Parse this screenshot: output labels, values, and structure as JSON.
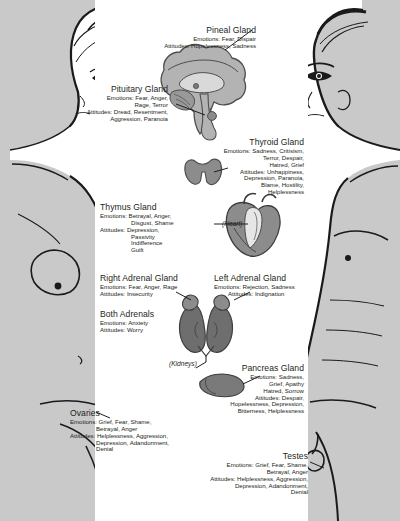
{
  "document": {
    "title": "Endocrine Glands, Emotions and Attitudes Chart",
    "background_color": "#ffffff",
    "body_fill_color": "#c9c9c9",
    "outline_color": "#1a1a1a",
    "organ_fill_color": "#8c8c8c",
    "text_color": "#231f20"
  },
  "figures": {
    "left": {
      "name": "female-figure",
      "caption": ""
    },
    "right": {
      "name": "male-figure",
      "caption": ""
    }
  },
  "organ_captions": {
    "heart": "(Heart)",
    "kidneys": "(Kidneys)"
  },
  "glands": [
    {
      "id": "pineal",
      "title": "Pineal Gland",
      "align": "right",
      "lines": [
        "Emotions: Fear, Dispair",
        "Attitudes: Hopelessness, Sadness"
      ]
    },
    {
      "id": "pituitary",
      "title": "Pituitary Gland",
      "align": "right",
      "lines": [
        "Emotions: Fear, Anger,",
        "Rage, Terror",
        "Attitudes: Dread, Resentment,",
        "Aggression, Paranoia"
      ]
    },
    {
      "id": "thyroid",
      "title": "Thyroid Gland",
      "align": "right",
      "lines": [
        "Emotions: Sadness, Critisism,",
        "Terror, Despair,",
        "Hatred, Grief",
        "Attitudes: Unhappiness,",
        "Depression, Paranoia,",
        "Blame, Hostility,",
        "Helplessness"
      ]
    },
    {
      "id": "thymus",
      "title": "Thymus Gland",
      "align": "left",
      "lines": [
        "Emotions: Betrayal, Anger,",
        "Disgust, Shame",
        "Attitudes: Depression,",
        "Passivity",
        "Indifference",
        "Guilt"
      ]
    },
    {
      "id": "right-adrenal",
      "title": "Right Adrenal Gland",
      "align": "left",
      "lines": [
        "Emotions: Fear, Anger, Rage",
        "Attitudes: Insecurity"
      ]
    },
    {
      "id": "left-adrenal",
      "title": "Left Adrenal Gland",
      "align": "left",
      "lines": [
        "Emotions: Rejection, Sadness",
        "Attitudes: Indignation"
      ]
    },
    {
      "id": "both-adrenals",
      "title": "Both Adrenals",
      "align": "left",
      "lines": [
        "Emotions: Anxiety",
        "Attitudes: Worry"
      ]
    },
    {
      "id": "pancreas",
      "title": "Pancreas Gland",
      "align": "right",
      "lines": [
        "Emotions: Sadness,",
        "Grief, Apathy",
        "Hatred, Sorrow",
        "Attitudes: Despair,",
        "Hopelessness, Depression,",
        "Bitterness, Helplessness"
      ]
    },
    {
      "id": "ovaries",
      "title": "Ovaries",
      "align": "right",
      "lines": [
        "Emotions: Grief, Fear, Shame,",
        "Betrayal, Anger",
        "Attitudes: Helplessness, Aggression,",
        "Depression, Adandonment,",
        "Denial"
      ]
    },
    {
      "id": "testes",
      "title": "Testes",
      "align": "right",
      "lines": [
        "Emotions: Grief, Fear, Shame,",
        "Betrayal, Anger",
        "Attitudes: Helplessness, Aggression,",
        "Depression, Adandonment,",
        "Denial"
      ]
    }
  ]
}
